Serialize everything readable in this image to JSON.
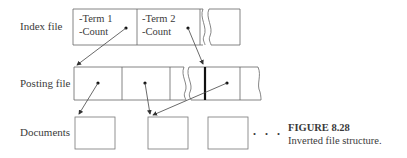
{
  "rows": {
    "index": {
      "label": "Index file"
    },
    "posting": {
      "label": "Posting file"
    },
    "documents": {
      "label": "Documents"
    }
  },
  "index_cells": [
    {
      "term": "-Term 1",
      "count": "-Count"
    },
    {
      "term": "-Term 2",
      "count": "-Count"
    }
  ],
  "ellipsis": ". . .",
  "caption": {
    "title": "FIGURE 8.28",
    "subtitle": "Inverted file structure."
  },
  "colors": {
    "line": "#555555",
    "background": "#ffffff"
  }
}
